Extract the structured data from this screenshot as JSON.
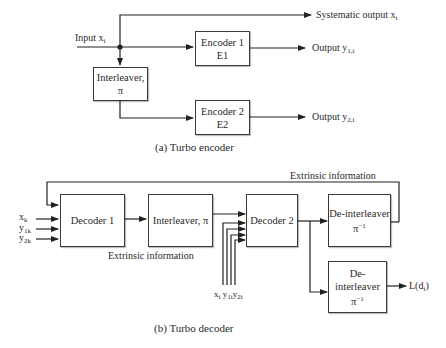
{
  "encoder": {
    "caption": "(a) Turbo encoder",
    "input_label": "Input x",
    "input_sub": "i",
    "systematic_label": "Systematic output x",
    "systematic_sub": "i",
    "encoder1": {
      "line1": "Encoder 1",
      "line2": "E1"
    },
    "encoder2": {
      "line1": "Encoder 2",
      "line2": "E2"
    },
    "interleaver": {
      "line1": "Interleaver,",
      "line2": "π"
    },
    "output1_label": "Output y",
    "output1_sub": "1,i",
    "output2_label": "Output y",
    "output2_sub": "2,i"
  },
  "decoder": {
    "caption": "(b) Turbo decoder",
    "feedback_label": "Extrinsic information",
    "extrinsic_label": "Extrinsic information",
    "decoder1": "Decoder 1",
    "interleaver": "Interleaver, π",
    "decoder2": "Decoder 2",
    "deinterleaver_top": {
      "line1": "De-interleaver",
      "line2": "π",
      "sup": "−1"
    },
    "deinterleaver_bottom": {
      "line1": "De-interleaver",
      "line2": "π",
      "sup": "−1"
    },
    "inputs_left": [
      {
        "base": "x",
        "sub": "k"
      },
      {
        "base": "y",
        "sub": "1k"
      },
      {
        "base": "y",
        "sub": "2k"
      }
    ],
    "inputs_bottom": [
      {
        "base": "x",
        "sub": "i"
      },
      {
        "base": "y",
        "sub": "1i"
      },
      {
        "base": "y",
        "sub": "2i"
      }
    ],
    "output_label": "L(d",
    "output_hat": "̂",
    "output_sub": "i",
    "output_close": ")"
  }
}
